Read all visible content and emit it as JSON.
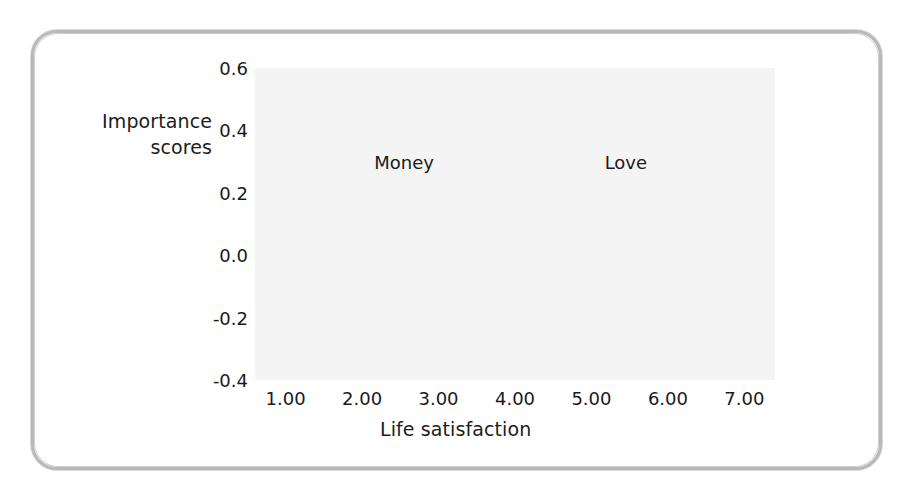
{
  "figure": {
    "y_axis_title_line1": "Importance",
    "y_axis_title_line2": "scores",
    "x_axis_title": "Life satisfaction"
  },
  "colors": {
    "money_line": "#c9c9c9",
    "love_line": "#9a9a9a",
    "grid": "#a8a8a8",
    "axis": "#555555",
    "plot_background": "#f4f4f4",
    "frame_border": "#b9b9b9",
    "text": "#1c1c1c"
  },
  "chart_data": {
    "type": "line",
    "title": "",
    "xlabel": "Life satisfaction",
    "ylabel": "Importance scores",
    "x": [
      1.0,
      2.0,
      3.0,
      4.0,
      5.0,
      6.0,
      7.0
    ],
    "xtick_labels": [
      "1.00",
      "2.00",
      "3.00",
      "4.00",
      "5.00",
      "6.00",
      "7.00"
    ],
    "ytick_labels": [
      "0.6",
      "0.4",
      "0.2",
      "0.0",
      "-0.2",
      "-0.4"
    ],
    "yticks": [
      0.6,
      0.4,
      0.2,
      0.0,
      -0.2,
      -0.4
    ],
    "xlim": [
      0.6,
      7.4
    ],
    "ylim": [
      -0.4,
      0.6
    ],
    "grid": true,
    "legend": "inline-labels",
    "series": [
      {
        "name": "Money",
        "color": "#c9c9c9",
        "label_x": 2.55,
        "label_y": 0.3,
        "values": [
          0.39,
          0.24,
          0.08,
          -0.08,
          -0.135,
          -0.16,
          -0.27
        ]
      },
      {
        "name": "Love",
        "color": "#9a9a9a",
        "label_x": 5.45,
        "label_y": 0.3,
        "values": [
          -0.165,
          -0.19,
          -0.14,
          -0.08,
          0.11,
          0.23,
          0.4
        ]
      }
    ]
  }
}
